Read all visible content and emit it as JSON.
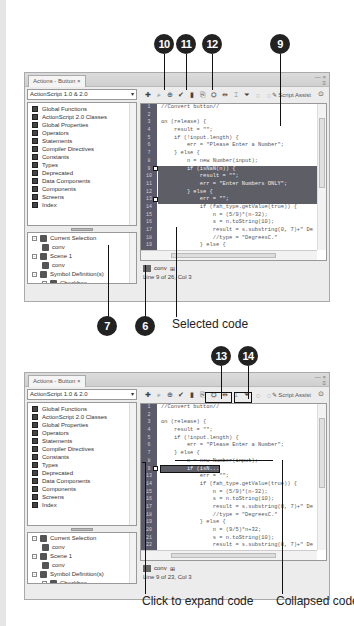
{
  "figure1": {
    "callouts": [
      "10",
      "11",
      "12",
      "9",
      "7",
      "6"
    ],
    "caption_selected": "Selected code",
    "panel": {
      "tab_label": "Actions - Button ×",
      "language_dropdown": "ActionScript 1.0 & 2.0",
      "toolbox_items": [
        "Global Functions",
        "ActionScript 2.0 Classes",
        "Global Properties",
        "Operators",
        "Statements",
        "Compiler Directives",
        "Constants",
        "Types",
        "Deprecated",
        "Data Components",
        "Components",
        "Screens",
        "Index"
      ],
      "nav_items": [
        {
          "label": "Current Selection",
          "level": 0,
          "expand": "−"
        },
        {
          "label": "conv",
          "level": 1,
          "expand": ""
        },
        {
          "label": "Scene 1",
          "level": 0,
          "expand": "−"
        },
        {
          "label": "conv",
          "level": 1,
          "expand": ""
        },
        {
          "label": "Symbol Definition(s)",
          "level": 0,
          "expand": "−"
        },
        {
          "label": "Checkbox",
          "level": 1,
          "expand": "+"
        }
      ],
      "script_assist_label": "Script Assist",
      "line_numbers": [
        "1",
        "2",
        "3",
        "4",
        "5",
        "6",
        "7",
        "8",
        "9",
        "10",
        "11",
        "12",
        "13",
        "14",
        "15",
        "16",
        "17",
        "18",
        "19"
      ],
      "code_lines": [
        "//Convert button//",
        "",
        "on (release) {",
        "    result = \"\";",
        "    if (!input.length) {",
        "        err = \"Please Enter a Number\";",
        "    } else {",
        "        n = new Number(input);",
        "        if (isNaN(n)) {",
        "            result = \"\";",
        "            err = \"Enter Numbers ONLY\";",
        "        } else {",
        "            err = \"\";",
        "            if (fah_type.getValue(true)) {",
        "                n = (5/9)*(n-32);",
        "                s = n.toString(10);",
        "                result = s.substring(0, 7)+\" De",
        "                //type = \"DegreesC.\"",
        "            } else {"
      ],
      "selected_lines": [
        9,
        10,
        11,
        12,
        13
      ],
      "script_tab_label": "conv",
      "status": "Line 9 of 26, Col 3"
    }
  },
  "figure2": {
    "callouts": [
      "13",
      "14"
    ],
    "caption_expand": "Click to expand code",
    "caption_collapsed": "Collapsed code",
    "panel": {
      "tab_label": "Actions - Button ×",
      "language_dropdown": "ActionScript 1.0 & 2.0",
      "toolbox_items": [
        "Global Functions",
        "ActionScript 2.0 Classes",
        "Global Properties",
        "Operators",
        "Statements",
        "Compiler Directives",
        "Constants",
        "Types",
        "Deprecated",
        "Data Components",
        "Components",
        "Screens",
        "Index"
      ],
      "nav_items": [
        {
          "label": "Current Selection",
          "level": 0,
          "expand": "−"
        },
        {
          "label": "conv",
          "level": 1,
          "expand": ""
        },
        {
          "label": "Scene 1",
          "level": 0,
          "expand": "−"
        },
        {
          "label": "conv",
          "level": 1,
          "expand": ""
        },
        {
          "label": "Symbol Definition(s)",
          "level": 0,
          "expand": "−"
        },
        {
          "label": "Checkbox",
          "level": 1,
          "expand": "+"
        }
      ],
      "script_assist_label": "Script Assist",
      "line_numbers": [
        "1",
        "2",
        "3",
        "4",
        "5",
        "6",
        "7",
        "8",
        "9",
        "13",
        "14",
        "15",
        "16",
        "17",
        "18",
        "19",
        "20",
        "21",
        "22"
      ],
      "code_lines": [
        "//Convert button//",
        "",
        "on (release) {",
        "    result = \"\";",
        "    if (!input.length) {",
        "        err = \"Please Enter a Number\";",
        "    } else {",
        "        n = new Number(input);",
        "        if (isN...",
        "            err = \"\";",
        "            if (fah_type.getValue(true)) {",
        "                n = (5/9)*(n-32);",
        "                s = n.toString(10);",
        "                result = s.substring(0, 7)+\" De",
        "                //type = \"DegreesC.\"",
        "            } else {",
        "                n = (9/5)*n+32;",
        "                s = n.toString(10);",
        "                result = s.substring(0, 7)+\" De"
      ],
      "collapsed_line": 9,
      "script_tab_label": "conv",
      "status": "Line 9 of 23, Col 3"
    }
  }
}
